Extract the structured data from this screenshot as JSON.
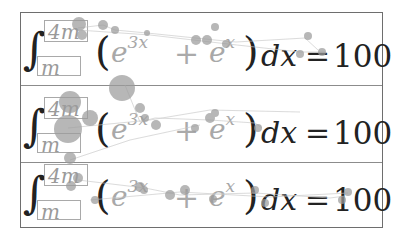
{
  "equation": {
    "integral_symbol": "∫",
    "lower_limit": "m",
    "upper_limit": "4m",
    "open_paren": "(",
    "close_paren": ")",
    "term1_base": "e",
    "term1_exp": "3x",
    "operator": "+",
    "term2_base": "e",
    "term2_exp": "x",
    "differential": "dx",
    "equals": "=",
    "rhs_value": "100"
  },
  "rows": [
    {
      "upper": "4m",
      "lower": "m",
      "base1": "e",
      "exp1": "3x",
      "op": "+",
      "base2": "e",
      "exp2": "x",
      "dx": "dx",
      "eq": "=",
      "rhs": "100"
    },
    {
      "upper": "4m",
      "lower": "m",
      "base1": "e",
      "exp1": "3x",
      "op": "+",
      "base2": "e",
      "exp2": "x",
      "dx": "dx",
      "eq": "=",
      "rhs": "100"
    },
    {
      "upper": "4m",
      "lower": "m",
      "base1": "e",
      "exp1": "3x",
      "op": "+",
      "base2": "e",
      "exp2": "x",
      "dx": "dx",
      "eq": "=",
      "rhs": "100"
    }
  ],
  "colors": {
    "ink": "#222222",
    "placeholder": "#a8a8a8",
    "border": "#6e6e6e",
    "overlay_dot": "#9c9c9c"
  }
}
